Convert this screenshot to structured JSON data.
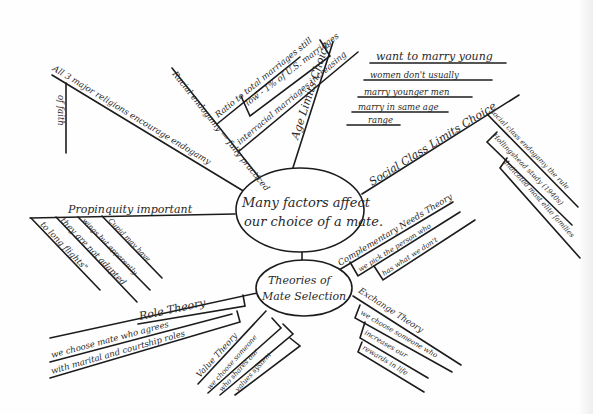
{
  "central": {
    "main_topic_line1": "Many factors affect",
    "main_topic_line2": "our choice of a mate.",
    "theories_line1": "Theories of",
    "theories_line2": "Mate Selection"
  },
  "branches": {
    "religion": {
      "main": "All 3 major religions encourage endogamy",
      "sub": "of faith"
    },
    "race": {
      "main": "Racial endogamy — fully practiced",
      "sub1": "Ratio to total marriages still",
      "sub2": "low - 1% of U.S. marriages",
      "sub3": "interracial marriages increasing"
    },
    "age": {
      "main": "Age Limits Choice",
      "lines": [
        "want to marry young",
        "women don't usually",
        "marry younger men",
        "marry in same age",
        "range"
      ]
    },
    "social_class": {
      "main": "Social Class Limits Choice",
      "lines": [
        "social class endogamy the rule",
        "Hollingshead study (1940s)",
        "Indicated most elite families"
      ]
    },
    "propinquity": {
      "main": "Propinquity important",
      "lines": [
        "Cupid may have",
        "wings but apparently",
        "they are not adapted",
        "to long flights\""
      ]
    },
    "complementary": {
      "main": "Complementary Needs Theory",
      "sub1": "we pick the person who",
      "sub2": "has what we don't"
    },
    "exchange": {
      "main": "Exchange Theory",
      "sub1": "we choose someone who",
      "sub2": "increases our",
      "sub3": "rewards in life"
    },
    "role": {
      "main": "Role Theory",
      "sub1": "we choose mate who agrees",
      "sub2": "with marital and courtship roles"
    },
    "value": {
      "main": "Value Theory",
      "sub1": "we choose someone",
      "sub2": "who shares our",
      "sub3": "values system"
    }
  },
  "colors": {
    "ink": "#1c1c1c",
    "paper": "#fefefe"
  }
}
